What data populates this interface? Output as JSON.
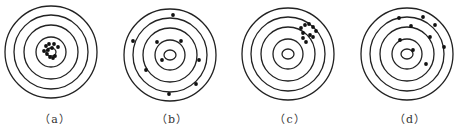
{
  "figure": {
    "ring_color": "#222222",
    "dot_color": "#111111",
    "targets": [
      {
        "id": "a",
        "label": "（a）",
        "center": [
          51,
          52
        ],
        "rings": [
          46,
          37,
          27,
          15
        ],
        "bullseye": [
          5,
          4
        ],
        "dots": [
          [
            46,
            46
          ],
          [
            49,
            44
          ],
          [
            54,
            44
          ],
          [
            58,
            47
          ],
          [
            44,
            51
          ],
          [
            47,
            54
          ],
          [
            50,
            57
          ],
          [
            53,
            58
          ],
          [
            55,
            56
          ],
          [
            48,
            50
          ],
          [
            52,
            48
          ]
        ]
      },
      {
        "id": "b",
        "label": "（b）",
        "center": [
          170,
          55
        ],
        "rings": [
          46,
          37,
          27,
          15
        ],
        "bullseye": [
          6,
          5
        ],
        "dots": [
          [
            173,
            15
          ],
          [
            133,
            41
          ],
          [
            157,
            42
          ],
          [
            181,
            41
          ],
          [
            162,
            60
          ],
          [
            199,
            60
          ],
          [
            146,
            70
          ],
          [
            196,
            84
          ],
          [
            169,
            94
          ]
        ]
      },
      {
        "id": "c",
        "label": "（c）",
        "center": [
          288,
          54
        ],
        "rings": [
          46,
          37,
          27,
          15
        ],
        "bullseye": [
          6,
          5
        ],
        "dots": [
          [
            301,
            28
          ],
          [
            305,
            25
          ],
          [
            309,
            24
          ],
          [
            313,
            27
          ],
          [
            316,
            31
          ],
          [
            303,
            33
          ],
          [
            310,
            35
          ],
          [
            303,
            38
          ],
          [
            306,
            42
          ],
          [
            313,
            37
          ]
        ]
      },
      {
        "id": "d",
        "label": "（d）",
        "center": [
          407,
          54
        ],
        "rings": [
          46,
          37,
          27,
          15
        ],
        "bullseye": [
          6,
          5
        ],
        "dots": [
          [
            399,
            18
          ],
          [
            423,
            17
          ],
          [
            435,
            25
          ],
          [
            411,
            26
          ],
          [
            430,
            37
          ],
          [
            400,
            40
          ],
          [
            444,
            47
          ],
          [
            413,
            50
          ],
          [
            426,
            64
          ]
        ]
      }
    ]
  },
  "labels": {
    "a": "（a）",
    "b": "（b）",
    "c": "（c）",
    "d": "（d）"
  }
}
